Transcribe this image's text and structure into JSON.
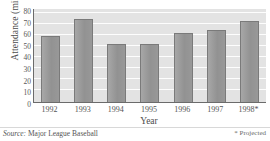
{
  "chart_data": {
    "type": "bar",
    "title": "",
    "xlabel": "Year",
    "ylabel": "Attendance (millions)",
    "categories": [
      "1992",
      "1993",
      "1994",
      "1995",
      "1996",
      "1997",
      "1998*"
    ],
    "values": [
      57,
      71,
      50,
      50,
      59,
      62,
      70
    ],
    "ylim": [
      0,
      80
    ],
    "ytick_values": [
      80,
      70,
      60,
      50,
      40,
      30,
      20,
      10,
      0
    ],
    "ytick_labels": [
      "80",
      "70",
      "60",
      "50",
      "40",
      "30",
      "20",
      "10",
      "0"
    ],
    "grid": true,
    "grid_orientation": "horizontal",
    "legend": "none",
    "bar_color": "#9b9b9b",
    "bar_edge_color": "#7a7a7a",
    "plot_background": "#e3e3e3",
    "gridline_color": "#fdfdfd",
    "axis_color": "#6b6b6b"
  },
  "footnotes": {
    "source_label": "Source:",
    "source_value": "Major League Baseball",
    "projected_note": "* Projected"
  }
}
